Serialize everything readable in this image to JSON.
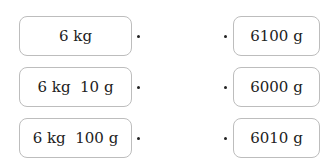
{
  "left_items": [
    {
      "label": "6 kg"
    },
    {
      "label": "6 kg  10 g"
    },
    {
      "label": "6 kg  100 g"
    }
  ],
  "right_items": [
    {
      "label": "6100 g"
    },
    {
      "label": "6000 g"
    },
    {
      "label": "6010 g"
    }
  ]
}
